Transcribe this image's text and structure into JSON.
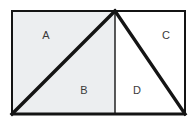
{
  "figure": {
    "type": "geometry-diagram",
    "background_color": "#ffffff",
    "stroke_color": "#141414",
    "label_color": "#3a3a3a",
    "frame": {
      "left": 11,
      "top": 10,
      "right": 186,
      "bottom": 115,
      "border_width_top": 2,
      "border_width_left": 2,
      "border_width_right": 2,
      "border_width_bottom": 3
    },
    "apex": {
      "x": 115,
      "y": 11
    },
    "divider": {
      "name": "vertical-divider",
      "x": 115,
      "y_top": 11,
      "y_bottom": 115,
      "width": 1.4
    },
    "diagonals": [
      {
        "name": "left-diagonal",
        "x1": 12,
        "y1": 114,
        "x2": 115,
        "y2": 11,
        "width": 3.4
      },
      {
        "name": "right-diagonal",
        "x1": 115,
        "y1": 11,
        "x2": 185,
        "y2": 114,
        "width": 3.4
      }
    ],
    "fills": {
      "left_half_color": "#eceef0",
      "right_half_color": "#ffffff"
    },
    "regions": [
      {
        "id": "A",
        "label": "A",
        "x": 46,
        "y": 36,
        "fill": "#eceef0"
      },
      {
        "id": "B",
        "label": "B",
        "x": 84,
        "y": 91,
        "fill": "#eceef0"
      },
      {
        "id": "C",
        "label": "C",
        "x": 166,
        "y": 36,
        "fill": "#ffffff"
      },
      {
        "id": "D",
        "label": "D",
        "x": 137,
        "y": 91,
        "fill": "#ffffff"
      }
    ]
  }
}
